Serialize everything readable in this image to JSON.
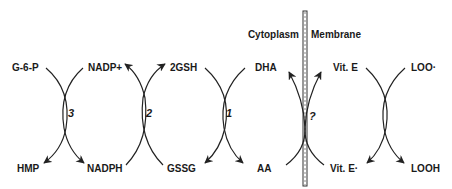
{
  "diagram": {
    "regions": {
      "left": "Cytoplasm",
      "right": "Membrane"
    },
    "labels": {
      "g6p": "G-6-P",
      "hmp": "HMP",
      "nadp_plus": "NADP+",
      "nadph": "NADPH",
      "gsh2": "2GSH",
      "gssg": "GSSG",
      "dha": "DHA",
      "aa": "AA",
      "vit_e": "Vit. E",
      "vit_e_radical": "Vit. E·",
      "loo_radical": "LOO·",
      "looh": "LOOH"
    },
    "reactions": {
      "r3": "3",
      "r2": "2",
      "r1": "1",
      "rq": "?"
    }
  }
}
